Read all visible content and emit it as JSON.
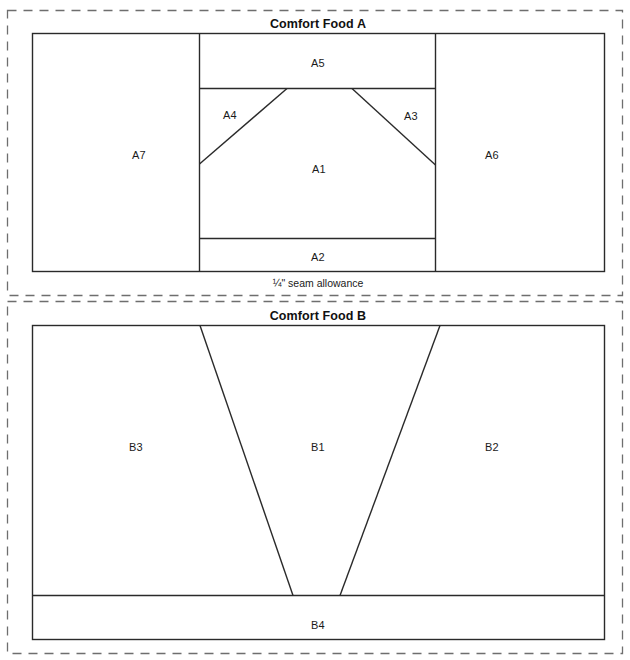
{
  "page": {
    "width": 630,
    "height": 660,
    "background": "#ffffff",
    "line_color": "#2a2a2a",
    "dashed_color": "#6e6e6e"
  },
  "blocks": [
    {
      "id": "comfort-food-a",
      "title": "Comfort Food A",
      "seam_note": "¼\" seam allowance",
      "pieces": [
        {
          "id": "A5",
          "label": "A5"
        },
        {
          "id": "A4",
          "label": "A4"
        },
        {
          "id": "A3",
          "label": "A3"
        },
        {
          "id": "A1",
          "label": "A1"
        },
        {
          "id": "A7",
          "label": "A7"
        },
        {
          "id": "A6",
          "label": "A6"
        },
        {
          "id": "A2",
          "label": "A2"
        }
      ]
    },
    {
      "id": "comfort-food-b",
      "title": "Comfort Food B",
      "seam_note": "",
      "pieces": [
        {
          "id": "B3",
          "label": "B3"
        },
        {
          "id": "B1",
          "label": "B1"
        },
        {
          "id": "B2",
          "label": "B2"
        },
        {
          "id": "B4",
          "label": "B4"
        }
      ]
    }
  ],
  "labels": {
    "a_title": "Comfort Food A",
    "a_seam": "¼\" seam allowance",
    "b_title": "Comfort Food B",
    "A1": "A1",
    "A2": "A2",
    "A3": "A3",
    "A4": "A4",
    "A5": "A5",
    "A6": "A6",
    "A7": "A7",
    "B1": "B1",
    "B2": "B2",
    "B3": "B3",
    "B4": "B4"
  }
}
